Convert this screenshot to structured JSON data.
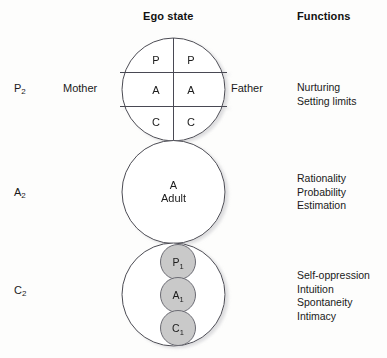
{
  "headers": {
    "ego_state": "Ego state",
    "functions": "Functions"
  },
  "side_labels": {
    "parent": {
      "base": "P",
      "sub": "2"
    },
    "adult": {
      "base": "A",
      "sub": "2"
    },
    "child": {
      "base": "C",
      "sub": "2"
    }
  },
  "role_labels": {
    "mother": "Mother",
    "father": "Father"
  },
  "circles": {
    "parent": {
      "left_column": [
        "P",
        "A",
        "C"
      ],
      "right_column": [
        "P",
        "A",
        "C"
      ]
    },
    "adult": {
      "line1": "A",
      "line2": "Adult"
    },
    "child": {
      "inner": [
        {
          "base": "P",
          "sub": "1"
        },
        {
          "base": "A",
          "sub": "1"
        },
        {
          "base": "C",
          "sub": "1"
        }
      ]
    }
  },
  "functions": {
    "parent": "Nurturing\nSetting limits",
    "adult": "Rationality\nProbability\nEstimation",
    "child": "Self-oppression\nIntuition\nSpontaneity\nIntimacy"
  },
  "colors": {
    "background": "#fdfdfc",
    "stroke": "#4a4a52",
    "inner_fill": "#c9c9c9",
    "text": "#1a1a1a"
  }
}
